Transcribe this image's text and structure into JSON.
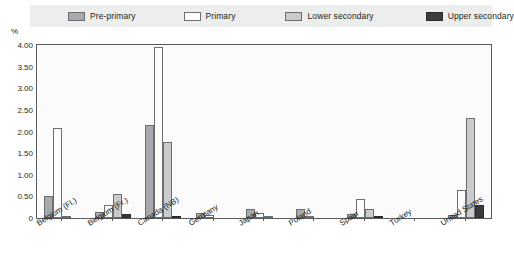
{
  "legend": {
    "items": [
      {
        "label": "Pre-primary",
        "key": "pre",
        "color": "#a7a9ac"
      },
      {
        "label": "Primary",
        "key": "primary",
        "color": "#fcfcfc"
      },
      {
        "label": "Lower secondary",
        "key": "lower",
        "color": "#c9cbcd"
      },
      {
        "label": "Upper secondary",
        "key": "upper",
        "color": "#3b3b3d"
      }
    ]
  },
  "axis": {
    "y_unit": "%",
    "y_ticks": [
      "4.00",
      "3.50",
      "3.00",
      "2.50",
      "2.00",
      "1.50",
      "1.00",
      "0.50",
      "0"
    ]
  },
  "chart_data": {
    "type": "bar",
    "title": "",
    "subtitle": "",
    "xlabel": "",
    "ylabel": "%",
    "ylim": [
      0,
      4.0
    ],
    "ytick_values": [
      0,
      0.5,
      1.0,
      1.5,
      2.0,
      2.5,
      3.0,
      3.5,
      4.0
    ],
    "grid": false,
    "legend_position": "top",
    "categories": [
      "Belgium (Fl.)",
      "Belgium (Fr.)",
      "Canada (NB)",
      "Germany",
      "Japan",
      "Poland",
      "Spain",
      "Turkey",
      "United States"
    ],
    "series": [
      {
        "name": "Pre-primary",
        "values": [
          0.52,
          0.13,
          2.15,
          0.12,
          0.2,
          0.2,
          0.1,
          0.0,
          0.08
        ]
      },
      {
        "name": "Primary",
        "values": [
          2.07,
          0.3,
          3.95,
          0.08,
          0.12,
          0.03,
          0.45,
          0.0,
          0.65
        ]
      },
      {
        "name": "Lower secondary",
        "values": [
          0.03,
          0.55,
          1.75,
          0.0,
          0.02,
          0.0,
          0.22,
          0.0,
          2.32
        ]
      },
      {
        "name": "Upper secondary",
        "values": [
          0.0,
          0.1,
          0.02,
          0.0,
          0.0,
          0.0,
          0.05,
          0.0,
          0.3
        ]
      }
    ]
  }
}
